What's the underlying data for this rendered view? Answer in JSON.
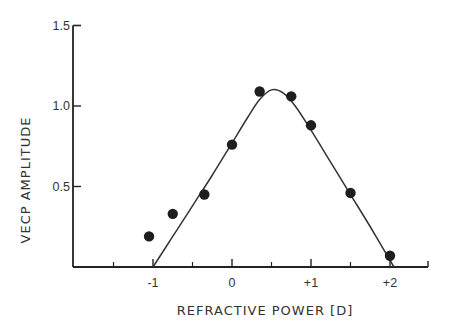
{
  "chart_data": {
    "type": "scatter",
    "title": "",
    "xlabel": "REFRACTIVE POWER [D]",
    "ylabel": "VECP AMPLITUDE",
    "xlim": [
      -2.0,
      2.5
    ],
    "ylim": [
      0,
      1.5
    ],
    "x_ticks": [
      -1,
      0,
      1,
      2
    ],
    "x_tick_labels": [
      "-1",
      "0",
      "+1",
      "+2"
    ],
    "x_minor_ticks": [
      -1.5,
      -0.5,
      0.5,
      1.5,
      2.5
    ],
    "y_ticks": [
      0.5,
      1.0,
      1.5
    ],
    "y_tick_labels": [
      "0.5",
      "1.0",
      "1.5"
    ],
    "grid": false,
    "legend": null,
    "series": [
      {
        "name": "measured",
        "kind": "scatter",
        "marker": "filled-circle",
        "x": [
          -1.05,
          -0.75,
          -0.35,
          0.0,
          0.35,
          0.75,
          1.0,
          1.5,
          2.0
        ],
        "y": [
          0.19,
          0.33,
          0.45,
          0.76,
          1.09,
          1.06,
          0.88,
          0.46,
          0.07
        ]
      },
      {
        "name": "fitted curve",
        "kind": "line",
        "x": [
          -1.0,
          -0.75,
          -0.5,
          -0.25,
          0.0,
          0.2,
          0.35,
          0.5,
          0.65,
          0.8,
          1.0,
          1.25,
          1.5,
          1.75,
          2.05
        ],
        "y": [
          0.0,
          0.19,
          0.38,
          0.57,
          0.77,
          0.93,
          1.04,
          1.1,
          1.08,
          1.0,
          0.85,
          0.65,
          0.45,
          0.25,
          0.0
        ]
      }
    ]
  },
  "axes": {
    "y_title": "VECP AMPLITUDE",
    "x_title": "REFRACTIVE POWER [D]"
  },
  "colors": {
    "ink": "#222222",
    "background": "#ffffff"
  }
}
